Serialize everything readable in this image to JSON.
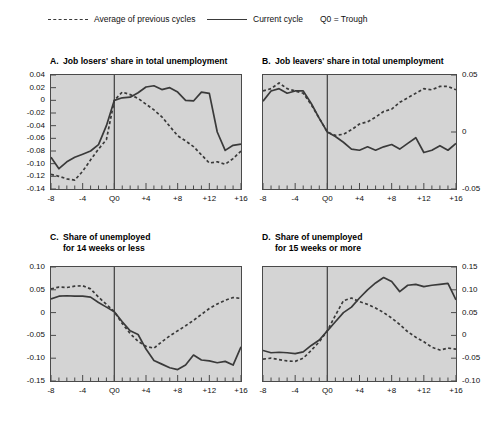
{
  "legend": {
    "items": [
      {
        "name": "average-previous-cycles",
        "label": "Average of previous cycles",
        "style": "dashed",
        "x": 48
      },
      {
        "name": "current-cycle",
        "label": "Current cycle",
        "style": "solid",
        "x": 207
      },
      {
        "name": "q0-trough",
        "label": "Q0 = Trough",
        "style": "text",
        "x": 320
      }
    ]
  },
  "panels": {
    "a": {
      "letter": "A.",
      "title": "Job losers' share in total unemployment"
    },
    "b": {
      "letter": "B.",
      "title": "Job leavers' share in total unemployment"
    },
    "c": {
      "letter": "C.",
      "title_line1": "Share of unemployed",
      "title_line2": "for 14 weeks or less"
    },
    "d": {
      "letter": "D.",
      "title_line1": "Share of unemployed",
      "title_line2": "for 15 weeks or more"
    }
  },
  "xticklabels": [
    "-8",
    "-4",
    "Q0",
    "+4",
    "+8",
    "+12",
    "+16"
  ],
  "chart_data": [
    {
      "id": "panel-a",
      "type": "line",
      "title": "A.  Job losers' share in total unemployment",
      "xlabel": "",
      "ylabel": "",
      "xlim": [
        -8,
        16
      ],
      "ylim": [
        -0.14,
        0.04
      ],
      "yticks": [
        0.04,
        0.02,
        0,
        -0.02,
        -0.04,
        -0.06,
        -0.08,
        -0.1,
        -0.12,
        -0.14
      ],
      "yticklabels": [
        "0.04",
        "0.02",
        "0",
        "-0.02",
        "-0.04",
        "-0.06",
        "-0.08",
        "-0.10",
        "-0.12",
        "-0.14"
      ],
      "xticks": [
        -8,
        -4,
        0,
        4,
        8,
        12,
        16
      ],
      "xticklabels": [
        "-8",
        "-4",
        "Q0",
        "+4",
        "+8",
        "+12",
        "+16"
      ],
      "yaxis_side": "left",
      "grid": false,
      "legend_position": "top",
      "vline_at": 0,
      "x": [
        -8,
        -7,
        -6,
        -5,
        -4,
        -3,
        -2,
        -1,
        0,
        1,
        2,
        3,
        4,
        5,
        6,
        7,
        8,
        9,
        10,
        11,
        12,
        13,
        14,
        15,
        16
      ],
      "series": [
        {
          "name": "Current cycle",
          "style": "solid",
          "values": [
            -0.09,
            -0.108,
            -0.097,
            -0.09,
            -0.085,
            -0.08,
            -0.07,
            -0.04,
            0.0,
            0.004,
            0.005,
            0.012,
            0.021,
            0.023,
            0.017,
            0.02,
            0.013,
            0.0,
            -0.001,
            0.013,
            0.011,
            -0.05,
            -0.079,
            -0.071,
            -0.069
          ]
        },
        {
          "name": "Average of previous cycles",
          "style": "dashed",
          "values": [
            -0.117,
            -0.12,
            -0.124,
            -0.126,
            -0.112,
            -0.094,
            -0.077,
            -0.062,
            0.0,
            0.013,
            0.009,
            0.003,
            -0.006,
            -0.015,
            -0.026,
            -0.041,
            -0.056,
            -0.064,
            -0.073,
            -0.086,
            -0.099,
            -0.097,
            -0.101,
            -0.092,
            -0.08
          ]
        }
      ]
    },
    {
      "id": "panel-b",
      "type": "line",
      "title": "B.  Job leavers' share in total unemployment",
      "xlabel": "",
      "ylabel": "",
      "xlim": [
        -8,
        16
      ],
      "ylim": [
        -0.05,
        0.05
      ],
      "yticks": [
        0.05,
        0,
        -0.05
      ],
      "yticklabels": [
        "0.05",
        "0",
        "-0.05"
      ],
      "xticks": [
        -8,
        -4,
        0,
        4,
        8,
        12,
        16
      ],
      "xticklabels": [
        "-8",
        "-4",
        "Q0",
        "+4",
        "+8",
        "+12",
        "+16"
      ],
      "yaxis_side": "right",
      "grid": false,
      "legend_position": "top",
      "vline_at": 0,
      "x": [
        -8,
        -7,
        -6,
        -5,
        -4,
        -3,
        -2,
        -1,
        0,
        1,
        2,
        3,
        4,
        5,
        6,
        7,
        8,
        9,
        10,
        11,
        12,
        13,
        14,
        15,
        16
      ],
      "series": [
        {
          "name": "Current cycle",
          "style": "solid",
          "values": [
            0.027,
            0.036,
            0.038,
            0.034,
            0.036,
            0.036,
            0.025,
            0.012,
            0.0,
            -0.004,
            -0.009,
            -0.015,
            -0.016,
            -0.013,
            -0.016,
            -0.013,
            -0.011,
            -0.015,
            -0.01,
            -0.005,
            -0.018,
            -0.016,
            -0.012,
            -0.016,
            -0.01
          ]
        },
        {
          "name": "Average of previous cycles",
          "style": "dashed",
          "values": [
            0.036,
            0.038,
            0.043,
            0.038,
            0.036,
            0.034,
            0.024,
            0.012,
            0.0,
            -0.003,
            -0.002,
            0.002,
            0.007,
            0.009,
            0.013,
            0.018,
            0.02,
            0.026,
            0.03,
            0.034,
            0.038,
            0.037,
            0.04,
            0.04,
            0.037
          ]
        }
      ]
    },
    {
      "id": "panel-c",
      "type": "line",
      "title": "C.  Share of unemployed for 14 weeks or less",
      "xlabel": "",
      "ylabel": "",
      "xlim": [
        -8,
        16
      ],
      "ylim": [
        -0.15,
        0.1
      ],
      "yticks": [
        0.1,
        0.05,
        0,
        -0.05,
        -0.1,
        -0.15
      ],
      "yticklabels": [
        "0.10",
        "0.05",
        "0",
        "-0.05",
        "-0.10",
        "-0.15"
      ],
      "xticks": [
        -8,
        -4,
        0,
        4,
        8,
        12,
        16
      ],
      "xticklabels": [
        "-8",
        "-4",
        "Q0",
        "+4",
        "+8",
        "+12",
        "+16"
      ],
      "yaxis_side": "left",
      "grid": false,
      "legend_position": "top",
      "vline_at": 0,
      "x": [
        -8,
        -7,
        -6,
        -5,
        -4,
        -3,
        -2,
        -1,
        0,
        1,
        2,
        3,
        4,
        5,
        6,
        7,
        8,
        9,
        10,
        11,
        12,
        13,
        14,
        15,
        16
      ],
      "series": [
        {
          "name": "Current cycle",
          "style": "solid",
          "values": [
            0.03,
            0.036,
            0.037,
            0.036,
            0.036,
            0.034,
            0.022,
            0.012,
            0.002,
            -0.02,
            -0.04,
            -0.048,
            -0.08,
            -0.105,
            -0.113,
            -0.121,
            -0.125,
            -0.115,
            -0.093,
            -0.104,
            -0.106,
            -0.11,
            -0.107,
            -0.115,
            -0.075
          ]
        },
        {
          "name": "Average of previous cycles",
          "style": "dashed",
          "values": [
            0.052,
            0.056,
            0.055,
            0.058,
            0.059,
            0.052,
            0.034,
            0.018,
            0.002,
            -0.024,
            -0.046,
            -0.063,
            -0.074,
            -0.078,
            -0.064,
            -0.051,
            -0.04,
            -0.029,
            -0.017,
            -0.004,
            0.009,
            0.019,
            0.027,
            0.033,
            0.031
          ]
        }
      ]
    },
    {
      "id": "panel-d",
      "type": "line",
      "title": "D.  Share of unemployed for 15 weeks or more",
      "xlabel": "",
      "ylabel": "",
      "xlim": [
        -8,
        16
      ],
      "ylim": [
        -0.1,
        0.15
      ],
      "yticks": [
        0.15,
        0.1,
        0.05,
        0,
        -0.05,
        -0.1
      ],
      "yticklabels": [
        "0.15",
        "0.10",
        "0.05",
        "0",
        "-0.05",
        "-0.10"
      ],
      "xticks": [
        -8,
        -4,
        0,
        4,
        8,
        12,
        16
      ],
      "xticklabels": [
        "-8",
        "-4",
        "Q0",
        "+4",
        "+8",
        "+12",
        "+16"
      ],
      "yaxis_side": "right",
      "grid": false,
      "legend_position": "top",
      "vline_at": 0,
      "x": [
        -8,
        -7,
        -6,
        -5,
        -4,
        -3,
        -2,
        -1,
        0,
        1,
        2,
        3,
        4,
        5,
        6,
        7,
        8,
        9,
        10,
        11,
        12,
        13,
        14,
        15,
        16
      ],
      "series": [
        {
          "name": "Current cycle",
          "style": "solid",
          "values": [
            -0.033,
            -0.038,
            -0.037,
            -0.038,
            -0.04,
            -0.036,
            -0.022,
            -0.01,
            0.01,
            0.03,
            0.05,
            0.062,
            0.082,
            0.1,
            0.115,
            0.127,
            0.118,
            0.096,
            0.11,
            0.112,
            0.107,
            0.11,
            0.112,
            0.114,
            0.078
          ]
        },
        {
          "name": "Average of previous cycles",
          "style": "dashed",
          "values": [
            -0.052,
            -0.05,
            -0.053,
            -0.056,
            -0.057,
            -0.05,
            -0.033,
            -0.014,
            0.01,
            0.044,
            0.076,
            0.082,
            0.074,
            0.068,
            0.06,
            0.05,
            0.038,
            0.024,
            0.008,
            -0.004,
            -0.014,
            -0.026,
            -0.032,
            -0.028,
            -0.03
          ]
        }
      ]
    }
  ],
  "colors": {
    "plot_background": "#d4d4d4",
    "axis": "#4a4a4a",
    "line": "#3a3a3a",
    "text": "#111111",
    "page_background": "#ffffff"
  }
}
